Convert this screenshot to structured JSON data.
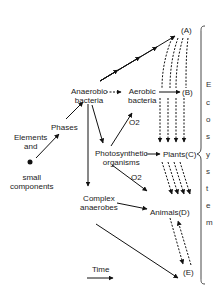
{
  "diagram": {
    "nodes": {
      "elements": {
        "line1": "Elements",
        "line2": "and"
      },
      "small": {
        "line1": "small",
        "line2": "components"
      },
      "phases": "Phases",
      "anaerobic": {
        "line1": "Anaerobic",
        "line2": "bacteria"
      },
      "aerobic": {
        "line1": "Aerobic",
        "line2": "bacteria"
      },
      "photosynthetic": {
        "line1": "Photosynthetic",
        "line2": "organisms"
      },
      "complex": {
        "line1": "Complex",
        "line2": "anaerobes"
      },
      "A": "(A)",
      "B": "(B)",
      "C": "Plants(C)",
      "D": "Animals(D)",
      "E": "(E)"
    },
    "o2_label_1": "O2",
    "o2_label_2": "O2",
    "time_label": "Time",
    "bracket_label_letters": [
      "E",
      "c",
      "o",
      "s",
      "y",
      "s",
      "t",
      "e",
      "m"
    ],
    "bracket_label": "Ecosystem"
  }
}
